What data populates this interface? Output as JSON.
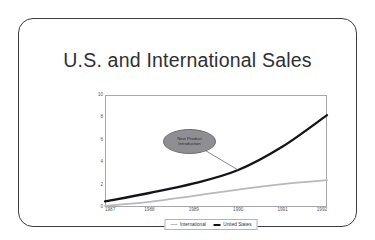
{
  "slide": {
    "title": "U.S. and International Sales",
    "background_color": "#ffffff",
    "border_color": "#3c3c41"
  },
  "chart_data": {
    "type": "line",
    "title": "U.S. and International Sales",
    "xlabel": "",
    "ylabel": "",
    "categories": [
      "1987",
      "1988",
      "1989",
      "1990",
      "1991",
      "1992"
    ],
    "x": [
      1987,
      1988,
      1989,
      1990,
      1991,
      1992
    ],
    "ylim": [
      0,
      10
    ],
    "xlim": [
      1987,
      1992
    ],
    "y_ticks": [
      "0",
      "2",
      "4",
      "6",
      "8",
      "10"
    ],
    "y_tick_values": [
      0,
      2,
      4,
      6,
      8,
      10
    ],
    "grid": false,
    "legend_position": "bottom-center",
    "series": [
      {
        "name": "International",
        "color": "#b9b9bd",
        "line_width": "thin",
        "values": [
          0.1,
          0.45,
          1.0,
          1.55,
          2.05,
          2.4
        ]
      },
      {
        "name": "United States",
        "color": "#141418",
        "line_width": "thick",
        "values": [
          0.5,
          1.25,
          2.1,
          3.3,
          5.4,
          8.2
        ]
      }
    ],
    "annotations": [
      {
        "text_line1": "New Product",
        "text_line2": "Introduction",
        "shape": "ellipse",
        "fill_color": "#8f8f93",
        "points_to_series": "United States",
        "points_to_x": 1990
      }
    ]
  },
  "legend": {
    "items": [
      {
        "label": "International",
        "color": "#b9b9bd",
        "weight": "thin"
      },
      {
        "label": "United States",
        "color": "#141418",
        "weight": "thick"
      }
    ]
  }
}
